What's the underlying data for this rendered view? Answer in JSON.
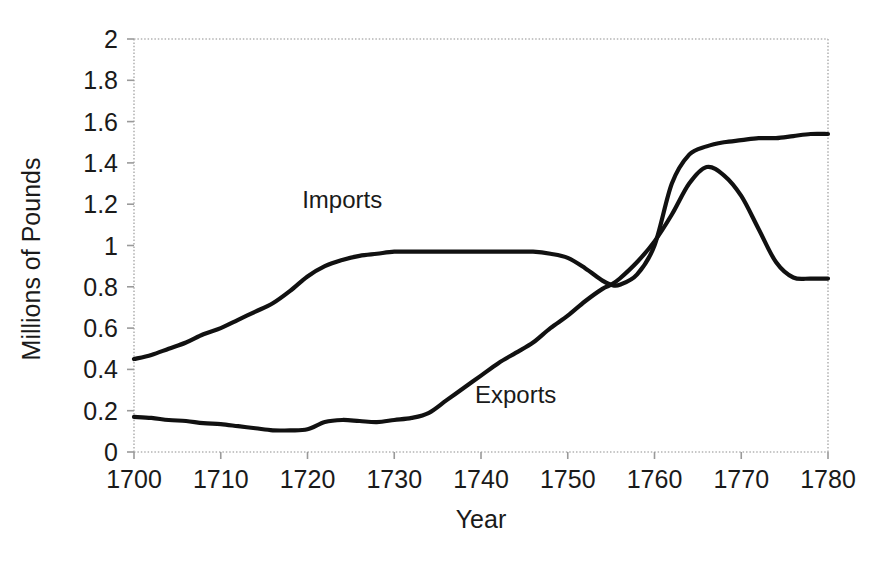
{
  "chart_data": {
    "type": "line",
    "title": "",
    "subtitle": "",
    "xlabel": "Year",
    "ylabel": "Millions of Pounds",
    "xlim": [
      1700,
      1780
    ],
    "ylim": [
      0,
      2
    ],
    "xticks": [
      1700,
      1710,
      1720,
      1730,
      1740,
      1750,
      1760,
      1770,
      1780
    ],
    "xtick_labels": [
      "1700",
      "1710",
      "1720",
      "1730",
      "1740",
      "1750",
      "1760",
      "1770",
      "1780"
    ],
    "yticks": [
      0,
      0.2,
      0.4,
      0.6,
      0.8,
      1,
      1.2,
      1.4,
      1.6,
      1.8,
      2
    ],
    "ytick_labels": [
      "0",
      "0.2",
      "0.4",
      "0.6",
      "0.8",
      "1",
      "1.2",
      "1.4",
      "1.6",
      "1.8",
      "2"
    ],
    "grid": false,
    "frame": "dotted-box",
    "legend": "inline-annotations",
    "legend_position": "inside-plot",
    "line_color": "#111111",
    "frame_color": "#b4b4b4",
    "text_color": "#1a1a1a",
    "background_color": "#ffffff",
    "annotations": [
      {
        "text": "Imports",
        "x": 1724,
        "y": 1.18
      },
      {
        "text": "Exports",
        "x": 1744,
        "y": 0.235
      }
    ],
    "x": [
      1700,
      1702,
      1704,
      1706,
      1708,
      1710,
      1712,
      1714,
      1716,
      1718,
      1720,
      1722,
      1724,
      1726,
      1728,
      1730,
      1732,
      1734,
      1736,
      1738,
      1740,
      1742,
      1744,
      1746,
      1748,
      1750,
      1752,
      1754,
      1755,
      1756,
      1758,
      1760,
      1762,
      1764,
      1766,
      1768,
      1770,
      1772,
      1774,
      1776,
      1778,
      1780
    ],
    "series": [
      {
        "name": "Imports",
        "values": [
          0.45,
          0.47,
          0.5,
          0.53,
          0.57,
          0.6,
          0.64,
          0.68,
          0.72,
          0.78,
          0.85,
          0.9,
          0.93,
          0.95,
          0.96,
          0.97,
          0.97,
          0.97,
          0.97,
          0.97,
          0.97,
          0.97,
          0.97,
          0.97,
          0.96,
          0.94,
          0.89,
          0.83,
          0.81,
          0.81,
          0.86,
          1.0,
          1.3,
          1.44,
          1.48,
          1.5,
          1.51,
          1.52,
          1.52,
          1.53,
          1.54,
          1.54
        ]
      },
      {
        "name": "Exports",
        "values": [
          0.17,
          0.165,
          0.155,
          0.15,
          0.14,
          0.135,
          0.125,
          0.115,
          0.105,
          0.105,
          0.11,
          0.145,
          0.155,
          0.15,
          0.145,
          0.155,
          0.165,
          0.19,
          0.25,
          0.31,
          0.37,
          0.43,
          0.48,
          0.53,
          0.6,
          0.66,
          0.73,
          0.79,
          0.81,
          0.84,
          0.92,
          1.02,
          1.15,
          1.3,
          1.38,
          1.34,
          1.24,
          1.08,
          0.92,
          0.845,
          0.84,
          0.84
        ]
      }
    ]
  }
}
